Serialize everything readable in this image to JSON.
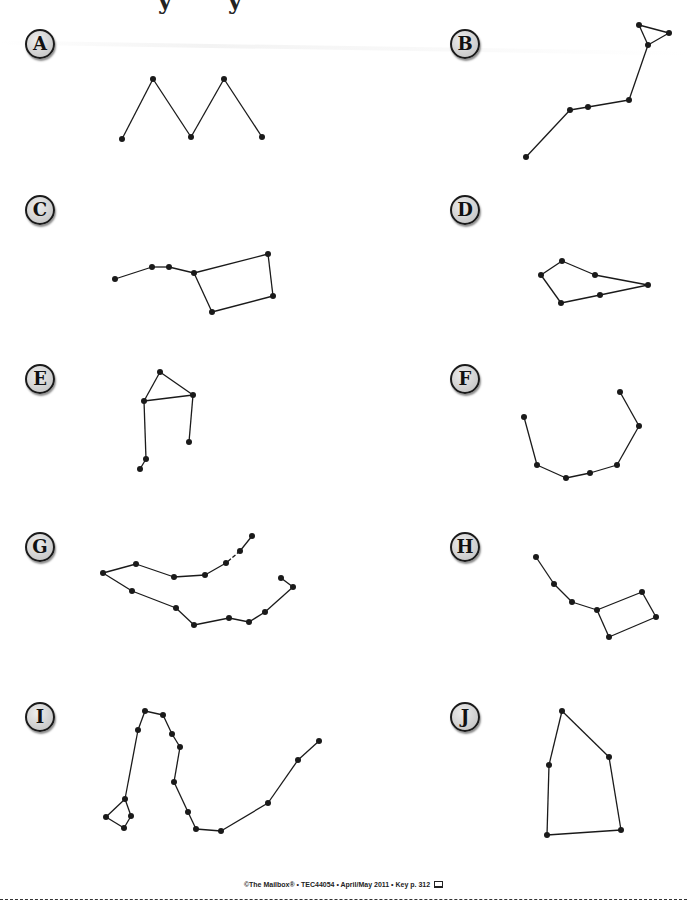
{
  "page": {
    "title_fragment": [
      "y",
      "y"
    ]
  },
  "colors": {
    "ink": "#1a1a1a",
    "badge_fill": "#d0d0d0",
    "background": "#ffffff"
  },
  "constellations": [
    {
      "label": "A",
      "stars": [
        [
          122,
          139
        ],
        [
          153,
          79
        ],
        [
          191,
          137
        ],
        [
          224,
          79
        ],
        [
          262,
          137
        ]
      ],
      "lines": [
        [
          0,
          1
        ],
        [
          1,
          2
        ],
        [
          2,
          3
        ],
        [
          3,
          4
        ]
      ]
    },
    {
      "label": "B",
      "stars": [
        [
          526,
          157
        ],
        [
          570,
          110
        ],
        [
          588,
          107
        ],
        [
          629,
          100
        ],
        [
          648,
          45
        ],
        [
          639,
          25
        ],
        [
          669,
          33
        ]
      ],
      "lines": [
        [
          0,
          1
        ],
        [
          1,
          2
        ],
        [
          2,
          3
        ],
        [
          3,
          4
        ],
        [
          4,
          5
        ],
        [
          5,
          6
        ],
        [
          6,
          4
        ]
      ]
    },
    {
      "label": "C",
      "stars": [
        [
          115,
          279
        ],
        [
          152,
          267
        ],
        [
          169,
          267
        ],
        [
          194,
          273
        ],
        [
          268,
          254
        ],
        [
          273,
          296
        ],
        [
          212,
          312
        ]
      ],
      "lines": [
        [
          0,
          1
        ],
        [
          1,
          2
        ],
        [
          2,
          3
        ],
        [
          3,
          4
        ],
        [
          4,
          5
        ],
        [
          5,
          6
        ],
        [
          6,
          3
        ]
      ]
    },
    {
      "label": "D",
      "stars": [
        [
          562,
          261
        ],
        [
          541,
          275
        ],
        [
          561,
          303
        ],
        [
          600,
          295
        ],
        [
          648,
          285
        ],
        [
          595,
          275
        ]
      ],
      "lines": [
        [
          0,
          1
        ],
        [
          1,
          2
        ],
        [
          2,
          3
        ],
        [
          3,
          4
        ],
        [
          4,
          5
        ],
        [
          5,
          0
        ]
      ]
    },
    {
      "label": "E",
      "stars": [
        [
          160,
          372
        ],
        [
          193,
          395
        ],
        [
          144,
          401
        ],
        [
          189,
          442
        ],
        [
          146,
          459
        ],
        [
          140,
          469
        ]
      ],
      "lines": [
        [
          0,
          1
        ],
        [
          1,
          2
        ],
        [
          2,
          0
        ],
        [
          1,
          3
        ],
        [
          2,
          4
        ],
        [
          4,
          5
        ]
      ]
    },
    {
      "label": "F",
      "stars": [
        [
          524,
          417
        ],
        [
          537,
          465
        ],
        [
          566,
          478
        ],
        [
          590,
          473
        ],
        [
          617,
          465
        ],
        [
          639,
          426
        ],
        [
          620,
          392
        ]
      ],
      "lines": [
        [
          0,
          1
        ],
        [
          1,
          2
        ],
        [
          2,
          3
        ],
        [
          3,
          4
        ],
        [
          4,
          5
        ],
        [
          5,
          6
        ]
      ]
    },
    {
      "label": "G",
      "stars": [
        [
          252,
          536
        ],
        [
          240,
          551
        ],
        [
          226,
          563
        ],
        [
          205,
          575
        ],
        [
          174,
          577
        ],
        [
          136,
          564
        ],
        [
          103,
          573
        ],
        [
          132,
          591
        ],
        [
          176,
          608
        ],
        [
          194,
          625
        ],
        [
          229,
          618
        ],
        [
          249,
          622
        ],
        [
          265,
          612
        ],
        [
          293,
          587
        ],
        [
          281,
          578
        ]
      ],
      "lines": [
        [
          0,
          1
        ],
        [
          1,
          2
        ],
        [
          2,
          3
        ],
        [
          3,
          4
        ],
        [
          4,
          5
        ],
        [
          5,
          6
        ],
        [
          6,
          7
        ],
        [
          7,
          8
        ],
        [
          8,
          9
        ],
        [
          9,
          10
        ],
        [
          10,
          11
        ],
        [
          11,
          12
        ],
        [
          12,
          13
        ],
        [
          13,
          14
        ]
      ],
      "dashed_lines": [
        [
          1,
          2
        ]
      ]
    },
    {
      "label": "H",
      "stars": [
        [
          536,
          557
        ],
        [
          554,
          584
        ],
        [
          572,
          602
        ],
        [
          597,
          610
        ],
        [
          642,
          592
        ],
        [
          656,
          617
        ],
        [
          609,
          637
        ]
      ],
      "lines": [
        [
          0,
          1
        ],
        [
          1,
          2
        ],
        [
          2,
          3
        ],
        [
          3,
          4
        ],
        [
          4,
          5
        ],
        [
          5,
          6
        ],
        [
          6,
          3
        ]
      ]
    },
    {
      "label": "I",
      "stars": [
        [
          319,
          741
        ],
        [
          298,
          760
        ],
        [
          268,
          803
        ],
        [
          221,
          831
        ],
        [
          196,
          829
        ],
        [
          188,
          812
        ],
        [
          174,
          782
        ],
        [
          180,
          747
        ],
        [
          172,
          734
        ],
        [
          163,
          715
        ],
        [
          145,
          711
        ],
        [
          138,
          730
        ],
        [
          125,
          799
        ],
        [
          131,
          816
        ],
        [
          124,
          828
        ],
        [
          106,
          817
        ]
      ],
      "lines": [
        [
          0,
          1
        ],
        [
          1,
          2
        ],
        [
          2,
          3
        ],
        [
          3,
          4
        ],
        [
          4,
          5
        ],
        [
          5,
          6
        ],
        [
          6,
          7
        ],
        [
          7,
          8
        ],
        [
          8,
          9
        ],
        [
          9,
          10
        ],
        [
          10,
          11
        ],
        [
          11,
          12
        ],
        [
          12,
          13
        ],
        [
          13,
          14
        ],
        [
          14,
          15
        ],
        [
          15,
          12
        ]
      ]
    },
    {
      "label": "J",
      "stars": [
        [
          562,
          711
        ],
        [
          609,
          757
        ],
        [
          621,
          830
        ],
        [
          547,
          835
        ],
        [
          549,
          765
        ]
      ],
      "lines": [
        [
          0,
          1
        ],
        [
          1,
          2
        ],
        [
          2,
          3
        ],
        [
          3,
          4
        ],
        [
          4,
          0
        ]
      ]
    }
  ],
  "footer": {
    "text": "©The Mailbox® • TEC44054 • April/May 2011 • Key p. 312",
    "icon": "computer-icon"
  }
}
